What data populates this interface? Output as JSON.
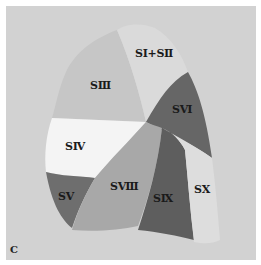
{
  "figure": {
    "panel_label": "C",
    "background_color": "#d2d2d2",
    "segments": [
      {
        "id": "S1S2",
        "label": "SⅠ+SⅡ",
        "color": "#d9d9d9"
      },
      {
        "id": "S3",
        "label": "SⅢ",
        "color": "#c9c9c9"
      },
      {
        "id": "S4",
        "label": "SⅣ",
        "color": "#f3f3f3"
      },
      {
        "id": "S5",
        "label": "SⅤ",
        "color": "#6e6e6e"
      },
      {
        "id": "S6",
        "label": "SⅥ",
        "color": "#666666"
      },
      {
        "id": "S8",
        "label": "SⅧ",
        "color": "#a8a8a8"
      },
      {
        "id": "S9",
        "label": "SⅨ",
        "color": "#5e5e5e"
      },
      {
        "id": "S10",
        "label": "SⅩ",
        "color": "#dcdcdc"
      }
    ]
  }
}
